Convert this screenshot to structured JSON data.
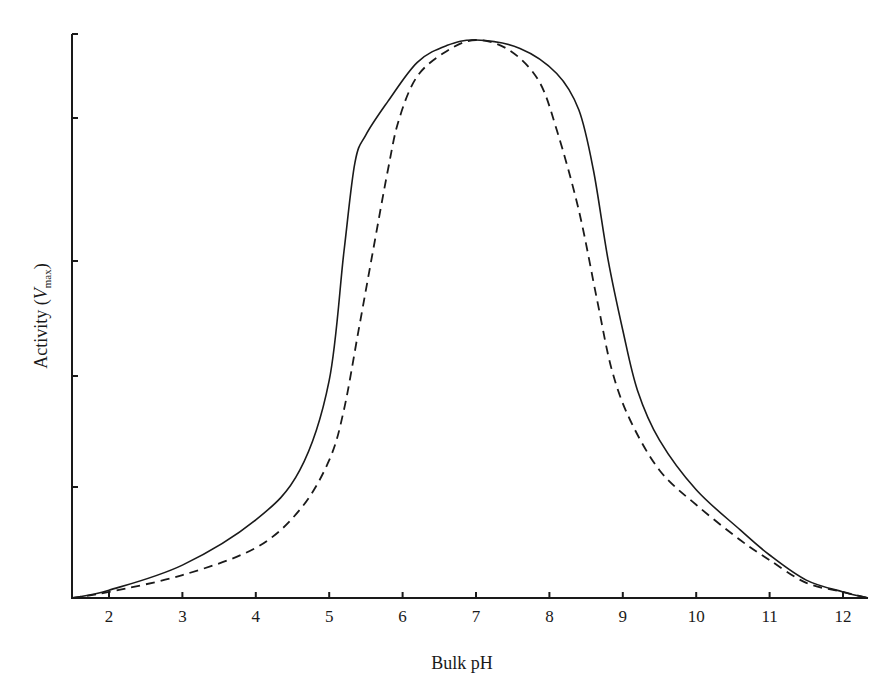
{
  "chart_data": {
    "type": "line",
    "title": "",
    "xlabel": "Bulk pH",
    "ylabel": "Activity (V_max)",
    "ylabel_parts": {
      "main": "Activity (",
      "italic": "V",
      "sub": "max",
      "close": ")"
    },
    "xlim": [
      1.5,
      12.35
    ],
    "ylim": [
      0,
      1.0
    ],
    "xticks": [
      2,
      3,
      4,
      5,
      6,
      7,
      8,
      9,
      10,
      11,
      12
    ],
    "xtick_labels": [
      "2",
      "3",
      "4",
      "5",
      "6",
      "7",
      "8",
      "9",
      "10",
      "11",
      "12"
    ],
    "yticks_fraction": [
      0,
      0.2,
      0.4,
      0.605,
      0.86,
      1.01
    ],
    "ytick_labels": [],
    "grid": false,
    "legend": null,
    "series": [
      {
        "name": "solid",
        "style": "solid",
        "color": "#1a1a1a",
        "x": [
          1.5,
          2,
          3,
          4,
          4.6,
          5.0,
          5.2,
          5.35,
          5.5,
          5.8,
          6.2,
          6.6,
          7.0,
          7.6,
          8.1,
          8.4,
          8.6,
          8.8,
          9.0,
          9.2,
          9.5,
          10.0,
          10.6,
          11.0,
          11.5,
          12.0,
          12.35
        ],
        "y": [
          0.0,
          0.014,
          0.059,
          0.14,
          0.229,
          0.39,
          0.62,
          0.78,
          0.83,
          0.89,
          0.96,
          0.99,
          1.0,
          0.985,
          0.94,
          0.875,
          0.767,
          0.606,
          0.48,
          0.372,
          0.283,
          0.194,
          0.122,
          0.077,
          0.032,
          0.011,
          0.0
        ]
      },
      {
        "name": "dashed",
        "style": "dashed",
        "color": "#1a1a1a",
        "x": [
          1.5,
          2,
          3,
          4,
          4.6,
          5.0,
          5.2,
          5.4,
          5.6,
          5.8,
          5.95,
          6.2,
          6.6,
          7.0,
          7.45,
          7.85,
          8.1,
          8.4,
          8.65,
          8.85,
          9.1,
          9.5,
          10.0,
          10.6,
          11.0,
          11.5,
          12.0,
          12.35
        ],
        "y": [
          0.0,
          0.011,
          0.041,
          0.09,
          0.158,
          0.247,
          0.337,
          0.48,
          0.624,
          0.767,
          0.857,
          0.935,
          0.98,
          1.0,
          0.982,
          0.928,
          0.839,
          0.695,
          0.534,
          0.409,
          0.319,
          0.229,
          0.167,
          0.104,
          0.068,
          0.027,
          0.011,
          0.0
        ]
      }
    ]
  },
  "page": {
    "clipped_caption": ""
  }
}
